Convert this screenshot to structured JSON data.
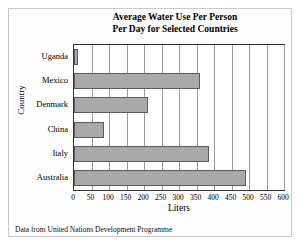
{
  "chart_data": {
    "type": "bar",
    "orientation": "horizontal",
    "title": "Average Water Use Per Person Per Day for Selected Countries",
    "title_lines": [
      "Average Water Use Per Person",
      "Per Day for Selected Countries"
    ],
    "categories": [
      "Uganda",
      "Mexico",
      "Denmark",
      "China",
      "Italy",
      "Australia"
    ],
    "values": [
      10,
      360,
      210,
      85,
      385,
      490
    ],
    "xlabel": "Liters",
    "ylabel": "Country",
    "xlim": [
      0,
      600
    ],
    "ylim": null,
    "xticks": [
      0,
      50,
      100,
      150,
      200,
      250,
      300,
      350,
      400,
      450,
      500,
      550,
      600
    ],
    "xtick_labels": [
      "0",
      "50",
      "100",
      "150",
      "200",
      "250",
      "300",
      "350",
      "400",
      "450",
      "500",
      "550",
      "600"
    ],
    "grid": "vertical",
    "legend": null,
    "bar_color": "#a9a9a9",
    "bar_edge_color": "#5b5b5b",
    "plot_background": "#ffffff",
    "axis_color": "#333333",
    "gridline_color": "#9a9a9a"
  },
  "caption": "Data from United Nations Development Programme"
}
